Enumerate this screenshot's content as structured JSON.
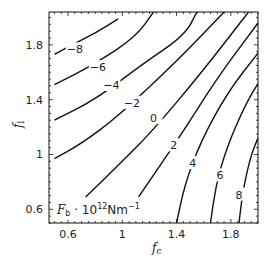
{
  "chart_data": {
    "type": "contour",
    "title": "",
    "annotation": "Fb · 10^12 Nm^-1",
    "annotation_parts": {
      "main": "F",
      "sub": "b",
      "mid": " · 10",
      "sup": "12",
      "unit": "Nm",
      "unit_sup": "−1"
    },
    "xlabel": "fc",
    "xlabel_parts": {
      "main": "f",
      "sub": "c"
    },
    "ylabel": "fl",
    "ylabel_parts": {
      "main": "f",
      "sub": "l"
    },
    "xlim": [
      0.46,
      2.0
    ],
    "ylim": [
      0.5,
      2.04
    ],
    "x_ticks": [
      0.6,
      1.0,
      1.4,
      1.8
    ],
    "x_tick_labels": [
      "0.6",
      "1",
      "1.4",
      "1.8"
    ],
    "y_ticks": [
      0.6,
      1.0,
      1.4,
      1.8
    ],
    "y_tick_labels": [
      "0.6",
      "1",
      "1.4",
      "1.8"
    ],
    "grid": false,
    "contour_levels": [
      -8,
      -6,
      -4,
      -2,
      0,
      2,
      4,
      6,
      8
    ],
    "contours": [
      {
        "level": -8,
        "label": "−8",
        "points": [
          [
            0.5,
            1.73
          ],
          [
            0.63,
            1.8
          ],
          [
            0.81,
            1.89
          ],
          [
            0.97,
            1.99
          ]
        ]
      },
      {
        "level": -6,
        "label": "−6",
        "points": [
          [
            0.5,
            1.51
          ],
          [
            0.8,
            1.66
          ],
          [
            1.1,
            1.86
          ],
          [
            1.23,
            2.04
          ]
        ]
      },
      {
        "level": -4,
        "label": "−4",
        "points": [
          [
            0.5,
            1.25
          ],
          [
            0.8,
            1.4
          ],
          [
            1.15,
            1.66
          ],
          [
            1.46,
            1.87
          ],
          [
            1.55,
            2.04
          ]
        ]
      },
      {
        "level": -2,
        "label": "−2",
        "points": [
          [
            0.5,
            0.97
          ],
          [
            0.7,
            1.08
          ],
          [
            0.97,
            1.28
          ],
          [
            1.4,
            1.68
          ],
          [
            1.75,
            2.04
          ]
        ]
      },
      {
        "level": 0,
        "label": "0",
        "points": [
          [
            0.73,
            0.69
          ],
          [
            1.0,
            0.95
          ],
          [
            1.22,
            1.17
          ],
          [
            1.57,
            1.58
          ],
          [
            1.93,
            2.04
          ]
        ]
      },
      {
        "level": 2,
        "label": "2",
        "points": [
          [
            1.12,
            0.69
          ],
          [
            1.3,
            0.95
          ],
          [
            1.47,
            1.2
          ],
          [
            1.7,
            1.56
          ],
          [
            2.0,
            1.96
          ]
        ]
      },
      {
        "level": 4,
        "label": "4",
        "points": [
          [
            1.4,
            0.5
          ],
          [
            1.46,
            0.78
          ],
          [
            1.58,
            1.1
          ],
          [
            1.78,
            1.46
          ],
          [
            2.0,
            1.74
          ]
        ]
      },
      {
        "level": 6,
        "label": "6",
        "points": [
          [
            1.65,
            0.5
          ],
          [
            1.69,
            0.78
          ],
          [
            1.77,
            1.05
          ],
          [
            1.9,
            1.35
          ],
          [
            2.0,
            1.52
          ]
        ]
      },
      {
        "level": 8,
        "label": "8",
        "points": [
          [
            1.86,
            0.5
          ],
          [
            1.89,
            0.75
          ],
          [
            1.95,
            1.0
          ],
          [
            2.0,
            1.12
          ]
        ]
      }
    ],
    "label_positions": [
      {
        "label": "−8",
        "x": 0.65,
        "y": 1.76
      },
      {
        "label": "−6",
        "x": 0.82,
        "y": 1.63
      },
      {
        "label": "−4",
        "x": 0.92,
        "y": 1.5
      },
      {
        "label": "−2",
        "x": 1.07,
        "y": 1.37
      },
      {
        "label": "0",
        "x": 1.23,
        "y": 1.26
      },
      {
        "label": "2",
        "x": 1.38,
        "y": 1.06
      },
      {
        "label": "4",
        "x": 1.52,
        "y": 0.93
      },
      {
        "label": "6",
        "x": 1.72,
        "y": 0.84
      },
      {
        "label": "8",
        "x": 1.86,
        "y": 0.7
      }
    ]
  },
  "colors": {
    "line": "#111111",
    "axis": "#111111",
    "text": "#222222",
    "background": "#ffffff"
  }
}
